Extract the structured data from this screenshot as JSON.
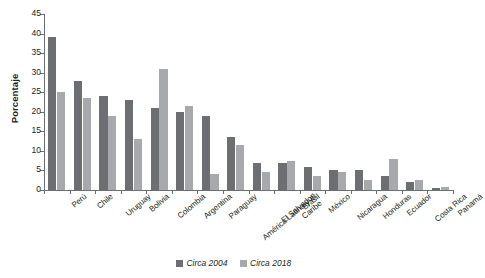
{
  "chart_data": {
    "type": "bar",
    "title": "",
    "subtitle": "",
    "xlabel": "",
    "ylabel": "Porcentaje",
    "ylim": [
      0,
      45
    ],
    "ytick_step": 5,
    "ytick_labels": [
      "0",
      "5",
      "10",
      "15",
      "20",
      "25",
      "30",
      "35",
      "40",
      "45"
    ],
    "grid": false,
    "legend_position": "bottom-center",
    "categories": [
      "Perú",
      "Chile",
      "Uruguay",
      "Bolivia",
      "Colombia",
      "Argentina",
      "Paraguay",
      "América Latina y el\nCaribe",
      "El Salvador",
      "Brasil",
      "México",
      "Nicaragua",
      "Honduras",
      "Ecuador",
      "Costa Rica",
      "Panamá"
    ],
    "series": [
      {
        "name": "Circa 2004",
        "color": "#6d6e71",
        "values": [
          39.0,
          28.0,
          24.0,
          23.0,
          21.0,
          20.0,
          19.0,
          13.5,
          7.0,
          7.0,
          6.0,
          5.0,
          5.0,
          3.5,
          2.0,
          0.5
        ]
      },
      {
        "name": "Circa 2018",
        "color": "#a7a9ac",
        "values": [
          25.0,
          23.5,
          19.0,
          13.0,
          31.0,
          21.5,
          4.0,
          11.5,
          4.5,
          7.5,
          3.5,
          4.5,
          2.5,
          8.0,
          2.5,
          0.7
        ]
      }
    ],
    "legend": [
      {
        "label": "Circa 2004",
        "color": "#6d6e71"
      },
      {
        "label": "Circa 2018",
        "color": "#a7a9ac"
      }
    ]
  },
  "axes": {
    "y_title": "Porcentaje"
  },
  "colors": {
    "series_2004": "#6d6e71",
    "series_2018": "#a7a9ac",
    "axis": "#6d6e71",
    "text": "#231f20",
    "background": "#ffffff"
  }
}
